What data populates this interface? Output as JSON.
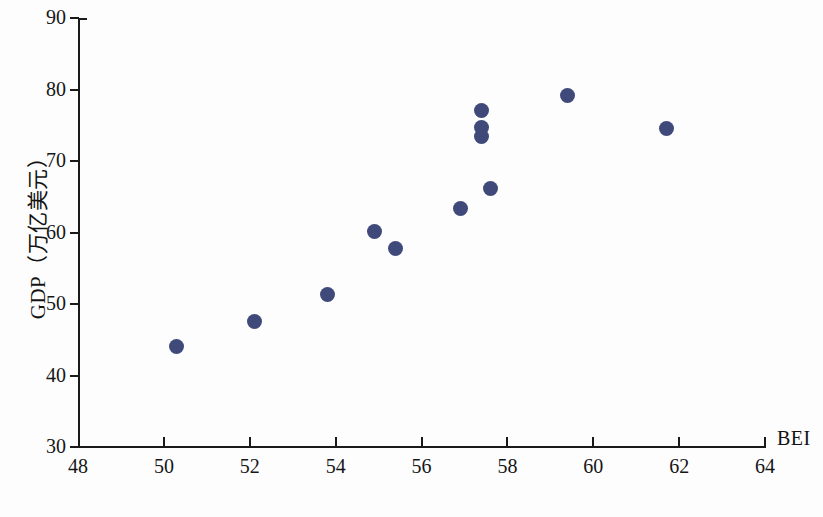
{
  "chart_data": {
    "type": "scatter",
    "title": "",
    "xlabel": "BEI",
    "ylabel": "GDP（万亿美元）",
    "xlim": [
      48,
      64
    ],
    "ylim": [
      30,
      90
    ],
    "xticks": [
      48,
      50,
      52,
      54,
      56,
      58,
      60,
      62,
      64
    ],
    "yticks": [
      30,
      40,
      50,
      60,
      70,
      80,
      90
    ],
    "grid": false,
    "legend": null,
    "marker_color": "#3f4a7a",
    "axis_color": "#1a1a1a",
    "series": [
      {
        "name": "GDP vs BEI",
        "points": [
          {
            "x": 50.3,
            "y": 44.0
          },
          {
            "x": 52.1,
            "y": 47.5
          },
          {
            "x": 53.8,
            "y": 51.3
          },
          {
            "x": 54.9,
            "y": 60.2
          },
          {
            "x": 55.4,
            "y": 57.8
          },
          {
            "x": 56.9,
            "y": 63.4
          },
          {
            "x": 57.6,
            "y": 66.1
          },
          {
            "x": 57.4,
            "y": 77.1
          },
          {
            "x": 57.4,
            "y": 74.7
          },
          {
            "x": 57.4,
            "y": 73.4
          },
          {
            "x": 59.4,
            "y": 79.1
          },
          {
            "x": 61.7,
            "y": 74.6
          }
        ]
      }
    ]
  },
  "caption": ""
}
